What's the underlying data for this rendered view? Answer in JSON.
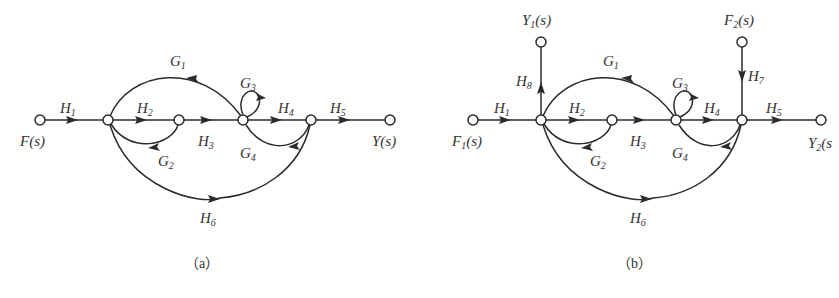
{
  "diagrams": [
    {
      "id": "a",
      "caption": "（a）",
      "nodes": {
        "input": {
          "label": "F(s)",
          "base": "F",
          "sub": "",
          "suffix": "(s)"
        },
        "output": {
          "label": "Y(s)",
          "base": "Y",
          "sub": "",
          "suffix": "(s)"
        }
      },
      "branches": [
        {
          "gain": "H1",
          "from": "F(s)",
          "to": "n1",
          "direction": "forward"
        },
        {
          "gain": "H2",
          "from": "n1",
          "to": "n2",
          "direction": "forward"
        },
        {
          "gain": "H3",
          "from": "n2",
          "to": "n3",
          "direction": "forward"
        },
        {
          "gain": "H4",
          "from": "n3",
          "to": "n4",
          "direction": "forward"
        },
        {
          "gain": "H5",
          "from": "n4",
          "to": "Y(s)",
          "direction": "forward"
        },
        {
          "gain": "H6",
          "from": "n1",
          "to": "n4",
          "direction": "forward"
        },
        {
          "gain": "G1",
          "from": "n3",
          "to": "n1",
          "direction": "feedback"
        },
        {
          "gain": "G2",
          "from": "n2",
          "to": "n1",
          "direction": "feedback"
        },
        {
          "gain": "G3",
          "from": "n3",
          "to": "n3",
          "direction": "self-loop"
        },
        {
          "gain": "G4",
          "from": "n4",
          "to": "n3",
          "direction": "feedback"
        }
      ]
    },
    {
      "id": "b",
      "caption": "（b）",
      "nodes": {
        "input1": {
          "label": "F1(s)",
          "base": "F",
          "sub": "1",
          "suffix": "(s)"
        },
        "input2": {
          "label": "F2(s)",
          "base": "F",
          "sub": "2",
          "suffix": "(s)"
        },
        "output1": {
          "label": "Y1(s)",
          "base": "Y",
          "sub": "1",
          "suffix": "(s)"
        },
        "output2": {
          "label": "Y2(s",
          "base": "Y",
          "sub": "2",
          "suffix": "(s"
        }
      },
      "branches": [
        {
          "gain": "H1",
          "from": "F1(s)",
          "to": "n1",
          "direction": "forward"
        },
        {
          "gain": "H2",
          "from": "n1",
          "to": "n2",
          "direction": "forward"
        },
        {
          "gain": "H3",
          "from": "n2",
          "to": "n3",
          "direction": "forward"
        },
        {
          "gain": "H4",
          "from": "n3",
          "to": "n4",
          "direction": "forward"
        },
        {
          "gain": "H5",
          "from": "n4",
          "to": "Y2(s)",
          "direction": "forward"
        },
        {
          "gain": "H6",
          "from": "n1",
          "to": "n4",
          "direction": "forward"
        },
        {
          "gain": "H7",
          "from": "F2(s)",
          "to": "n4",
          "direction": "forward"
        },
        {
          "gain": "H8",
          "from": "n1",
          "to": "Y1(s)",
          "direction": "forward"
        },
        {
          "gain": "G1",
          "from": "n3",
          "to": "n1",
          "direction": "feedback"
        },
        {
          "gain": "G2",
          "from": "n2",
          "to": "n1",
          "direction": "feedback"
        },
        {
          "gain": "G3",
          "from": "n3",
          "to": "n3",
          "direction": "self-loop"
        },
        {
          "gain": "G4",
          "from": "n4",
          "to": "n3",
          "direction": "feedback"
        }
      ]
    }
  ],
  "labels": {
    "H": "H",
    "G": "G",
    "s1": "1",
    "s2": "2",
    "s3": "3",
    "s4": "4",
    "s5": "5",
    "s6": "6",
    "s7": "7",
    "s8": "8"
  },
  "colors": {
    "stroke": "#2b2b2b",
    "text": "#333333",
    "background": "#ffffff"
  }
}
